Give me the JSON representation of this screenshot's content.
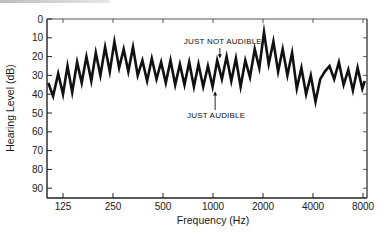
{
  "chart_data": {
    "type": "line",
    "title": "",
    "xlabel": "Frequency (Hz)",
    "ylabel": "Hearing Level (dB)",
    "x_scale": "log2",
    "x_ticks": [
      "125",
      "250",
      "500",
      "1000",
      "2000",
      "4000",
      "8000"
    ],
    "y_ticks": [
      "0",
      "10",
      "20",
      "30",
      "40",
      "50",
      "60",
      "70",
      "80",
      "90"
    ],
    "ylim": [
      0,
      95
    ],
    "y_inverted": true,
    "grid": false,
    "legend": null,
    "annotations": [
      {
        "text": "JUST NOT AUDIBLE",
        "x": 1100,
        "y": 22,
        "arrow": "down"
      },
      {
        "text": "JUST AUDIBLE",
        "x": 1030,
        "y": 37,
        "arrow": "up"
      }
    ],
    "series": [
      {
        "name": "Bekesy tracing",
        "points": [
          [
            102,
            34
          ],
          [
            109,
            41
          ],
          [
            117,
            29
          ],
          [
            125,
            40
          ],
          [
            133,
            25
          ],
          [
            142,
            39
          ],
          [
            152,
            23
          ],
          [
            162,
            34
          ],
          [
            173,
            20
          ],
          [
            185,
            33
          ],
          [
            197,
            18
          ],
          [
            210,
            30
          ],
          [
            224,
            15
          ],
          [
            239,
            28
          ],
          [
            255,
            12
          ],
          [
            272,
            26
          ],
          [
            290,
            16
          ],
          [
            309,
            28
          ],
          [
            330,
            15
          ],
          [
            352,
            30
          ],
          [
            376,
            22
          ],
          [
            401,
            33
          ],
          [
            428,
            21
          ],
          [
            457,
            32
          ],
          [
            487,
            23
          ],
          [
            520,
            34
          ],
          [
            555,
            22
          ],
          [
            592,
            35
          ],
          [
            632,
            24
          ],
          [
            674,
            35
          ],
          [
            719,
            23
          ],
          [
            767,
            36
          ],
          [
            818,
            24
          ],
          [
            873,
            36
          ],
          [
            932,
            25
          ],
          [
            994,
            36
          ],
          [
            1060,
            22
          ],
          [
            1131,
            32
          ],
          [
            1207,
            20
          ],
          [
            1288,
            33
          ],
          [
            1374,
            21
          ],
          [
            1466,
            36
          ],
          [
            1565,
            22
          ],
          [
            1670,
            31
          ],
          [
            1782,
            16
          ],
          [
            1901,
            26
          ],
          [
            2028,
            7
          ],
          [
            2164,
            24
          ],
          [
            2309,
            12
          ],
          [
            2464,
            28
          ],
          [
            2629,
            16
          ],
          [
            2805,
            30
          ],
          [
            2993,
            18
          ],
          [
            3194,
            37
          ],
          [
            3408,
            26
          ],
          [
            3636,
            40
          ],
          [
            3880,
            30
          ],
          [
            4140,
            44
          ],
          [
            4418,
            32
          ],
          [
            4714,
            28
          ],
          [
            5030,
            25
          ],
          [
            5367,
            32
          ],
          [
            5727,
            23
          ],
          [
            6111,
            35
          ],
          [
            6521,
            27
          ],
          [
            6958,
            38
          ],
          [
            7424,
            26
          ],
          [
            7922,
            37
          ],
          [
            8200,
            33
          ]
        ]
      }
    ]
  },
  "labels": {
    "xlabel": "Frequency (Hz)",
    "ylabel": "Hearing Level (dB)",
    "annot_top": "JUST NOT AUDIBLE",
    "annot_bottom": "JUST AUDIBLE",
    "x_ticks": [
      "125",
      "250",
      "500",
      "1000",
      "2000",
      "4000",
      "8000"
    ],
    "y_ticks": [
      "0",
      "10",
      "20",
      "30",
      "40",
      "50",
      "60",
      "70",
      "80",
      "90"
    ]
  }
}
